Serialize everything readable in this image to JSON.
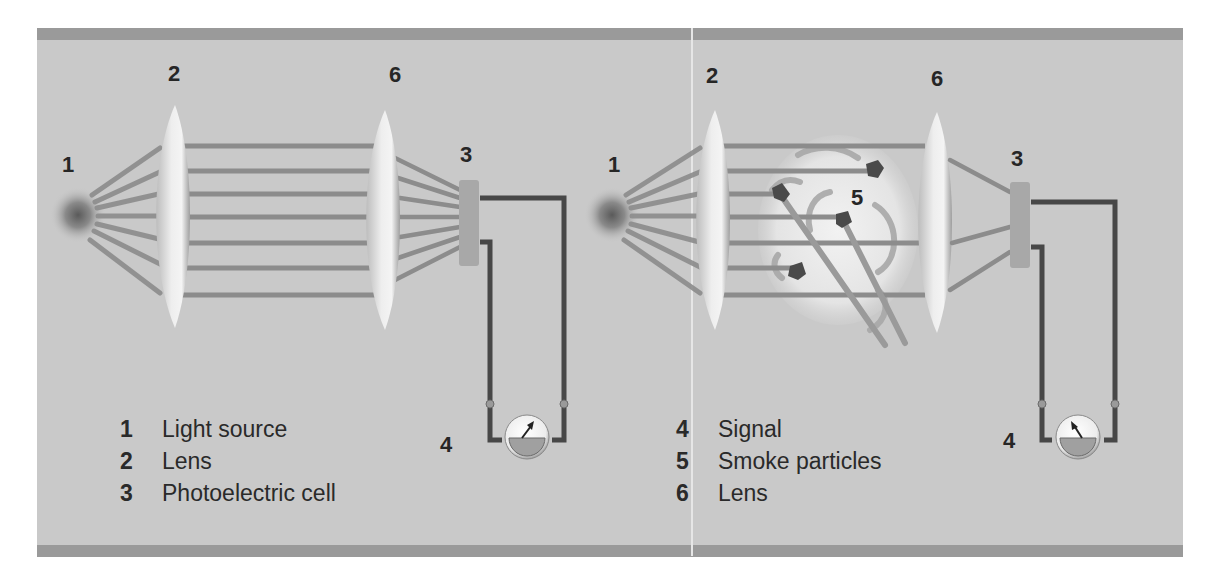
{
  "figure": {
    "colors": {
      "background": "#c9c9c9",
      "frame_bar": "#9a9a9a",
      "wire": "#474747",
      "beam": "#8c8c8c",
      "cell": "#a8a8a8",
      "text": "#262626"
    }
  },
  "left_panel": {
    "callouts": {
      "light_source": "1",
      "lens_a": "2",
      "lens_b": "6",
      "cell": "3",
      "signal": "4"
    },
    "legend": [
      {
        "num": "1",
        "label": "Light source"
      },
      {
        "num": "2",
        "label": "Lens"
      },
      {
        "num": "3",
        "label": "Photoelectric cell"
      }
    ]
  },
  "right_panel": {
    "callouts": {
      "light_source": "1",
      "lens_a": "2",
      "lens_b": "6",
      "cell": "3",
      "smoke": "5",
      "signal": "4"
    },
    "legend": [
      {
        "num": "4",
        "label": "Signal"
      },
      {
        "num": "5",
        "label": "Smoke particles"
      },
      {
        "num": "6",
        "label": "Lens"
      }
    ]
  }
}
